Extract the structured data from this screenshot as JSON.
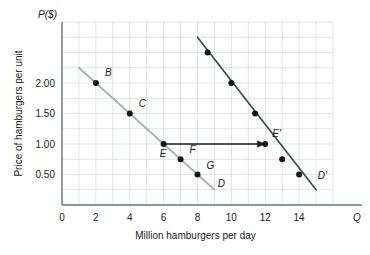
{
  "chart_data": {
    "type": "line",
    "title": "",
    "xlabel": "Million hamburgers per day",
    "ylabel": "Price of hamburgers per unit",
    "x_axis_symbol": "Q",
    "y_axis_symbol": "P($)",
    "xlim": [
      0,
      16
    ],
    "ylim": [
      0,
      3.0
    ],
    "xticks": [
      0,
      2,
      4,
      6,
      8,
      10,
      12,
      14
    ],
    "xtick_labels": [
      "0",
      "2",
      "4",
      "6",
      "8",
      "10",
      "12",
      "14"
    ],
    "yticks": [
      0.5,
      1.0,
      1.5,
      2.0
    ],
    "ytick_labels": [
      "0.50",
      "1.00",
      "1.50",
      "2.00"
    ],
    "grid": true,
    "grid_spacing_x": 1,
    "grid_spacing_y": 0.25,
    "legend": "none",
    "series": [
      {
        "name": "D",
        "label": "D",
        "color": "#9fb5ab",
        "label_x": 9.2,
        "label_y": 0.3,
        "line": [
          {
            "x": 1.0,
            "y": 2.25
          },
          {
            "x": 9.0,
            "y": 0.25
          }
        ],
        "points": [
          {
            "x": 2,
            "y": 2.0,
            "label": "B",
            "label_dx": 9,
            "label_dy": -7
          },
          {
            "x": 4,
            "y": 1.5,
            "label": "C",
            "label_dx": 9,
            "label_dy": -7
          },
          {
            "x": 6,
            "y": 1.0,
            "label": "E",
            "label_dx": -4,
            "label_dy": 13
          },
          {
            "x": 7,
            "y": 0.75,
            "label": "F",
            "label_dx": 9,
            "label_dy": -6
          },
          {
            "x": 8,
            "y": 0.5,
            "label": "G",
            "label_dx": 9,
            "label_dy": -6
          }
        ]
      },
      {
        "name": "D-prime",
        "label": "D'",
        "color": "#2c5647",
        "label_x": 15.1,
        "label_y": 0.42,
        "line": [
          {
            "x": 8.0,
            "y": 2.75
          },
          {
            "x": 15.0,
            "y": 0.25
          }
        ],
        "points": [
          {
            "x": 8.6,
            "y": 2.5,
            "label": "",
            "label_dx": 0,
            "label_dy": 0
          },
          {
            "x": 10.0,
            "y": 2.0,
            "label": "",
            "label_dx": 0,
            "label_dy": 0
          },
          {
            "x": 11.4,
            "y": 1.5,
            "label": "",
            "label_dx": 0,
            "label_dy": 0
          },
          {
            "x": 12.0,
            "y": 1.0,
            "label": "E'",
            "label_dx": 7,
            "label_dy": -7
          },
          {
            "x": 13.0,
            "y": 0.75,
            "label": "",
            "label_dx": 0,
            "label_dy": 0
          },
          {
            "x": 14.0,
            "y": 0.5,
            "label": "",
            "label_dx": 0,
            "label_dy": 0
          }
        ]
      }
    ],
    "annotations": [
      {
        "type": "arrow",
        "name": "shift-arrow",
        "from": {
          "x": 6,
          "y": 1.0
        },
        "to": {
          "x": 12,
          "y": 1.0
        },
        "color": "#1b1b1b"
      }
    ]
  }
}
